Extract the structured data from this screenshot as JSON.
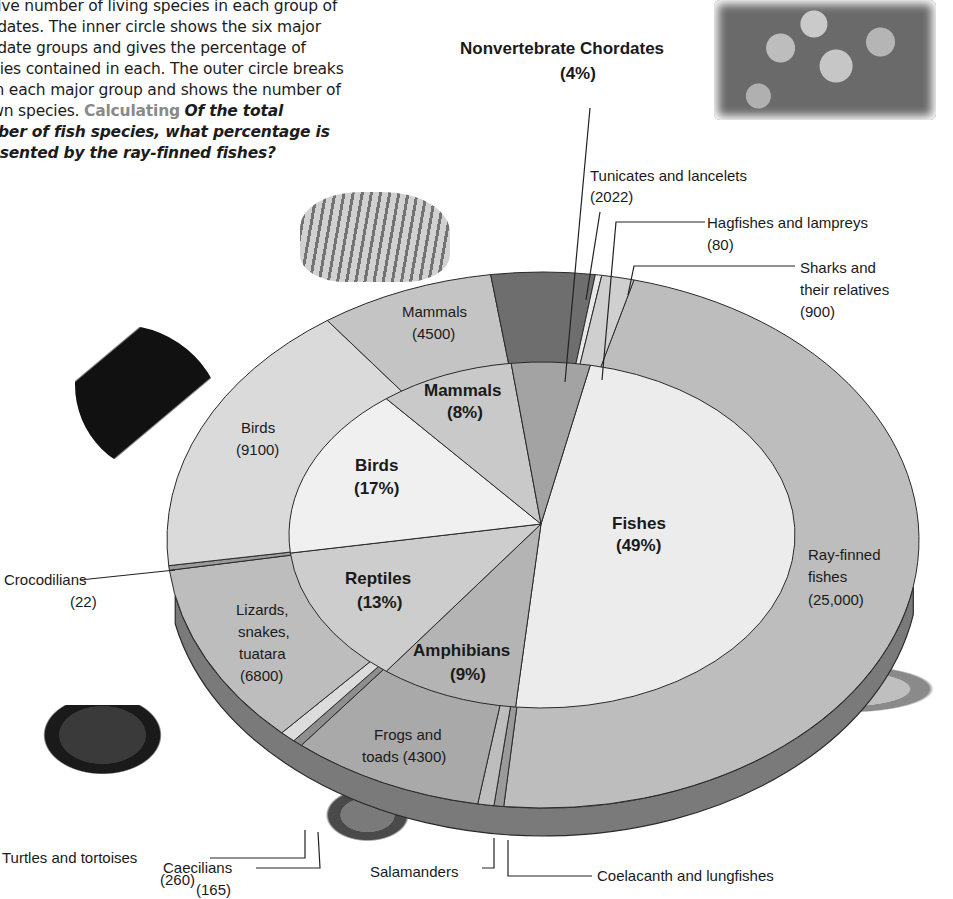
{
  "caption": {
    "line1": "ative number of living species in each group of",
    "line2": "ordates. The inner circle shows the six major",
    "line3": "ordate groups and gives the percentage of",
    "line4": "ecies contained in each. The outer circle breaks",
    "line5": "wn each major group and shows the number of",
    "line6_prefix": "own species. ",
    "keyword": "Calculating",
    "question_part1": "Of the total",
    "question_line2": "mber of fish species, what percentage is",
    "question_line3": "resented by the ray-finned fishes?"
  },
  "chart_data": {
    "type": "pie",
    "title": "",
    "subtype": "nested donut (3D)",
    "inner_ring": {
      "categories": [
        "Fishes",
        "Amphibians",
        "Reptiles",
        "Birds",
        "Mammals",
        "Nonvertebrate Chordates"
      ],
      "values": [
        49,
        9,
        13,
        17,
        8,
        4
      ],
      "unit": "%"
    },
    "outer_ring": {
      "categories": [
        "Ray-finned fishes",
        "Coelacanth and lungfishes",
        "Sharks and their relatives",
        "Hagfishes and lampreys",
        "Frogs and toads",
        "Salamanders",
        "Caecilians",
        "Turtles and tortoises",
        "Lizards, snakes, tuatara",
        "Crocodilians",
        "Birds",
        "Mammals",
        "Tunicates and lancelets"
      ],
      "parent": [
        "Fishes",
        "Fishes",
        "Fishes",
        "Fishes",
        "Amphibians",
        "Amphibians",
        "Amphibians",
        "Reptiles",
        "Reptiles",
        "Reptiles",
        "Birds",
        "Mammals",
        "Nonvertebrate Chordates"
      ],
      "values": [
        25000,
        null,
        900,
        80,
        4300,
        null,
        165,
        260,
        6800,
        22,
        9100,
        4500,
        2022
      ],
      "unit": "species"
    },
    "legend": "none"
  },
  "labels": {
    "nonvert_title": "Nonvertebrate Chordates",
    "nonvert_pct": "(4%)",
    "tunicates": "Tunicates and lancelets",
    "tunicates_n": "(2022)",
    "hagfishes": "Hagfishes and lampreys",
    "hagfishes_n": "(80)",
    "sharks1": "Sharks and",
    "sharks2": "their relatives",
    "sharks_n": "(900)",
    "mammals_outer": "Mammals",
    "mammals_outer_n": "(4500)",
    "mammals_inner": "Mammals",
    "mammals_inner_pct": "(8%)",
    "birds_outer": "Birds",
    "birds_outer_n": "(9100)",
    "birds_inner": "Birds",
    "birds_inner_pct": "(17%)",
    "fishes_inner": "Fishes",
    "fishes_inner_pct": "(49%)",
    "rayfinned1": "Ray-finned",
    "rayfinned2": "fishes",
    "rayfinned_n": "(25,000)",
    "crocodilians": "Crocodilians",
    "crocodilians_n": "(22)",
    "lizards1": "Lizards,",
    "lizards2": "snakes,",
    "lizards3": "tuatara",
    "lizards_n": "(6800)",
    "reptiles_inner": "Reptiles",
    "reptiles_inner_pct": "(13%)",
    "amphibians_inner": "Amphibians",
    "amphibians_inner_pct": "(9%)",
    "frogs1": "Frogs and",
    "frogs2": "toads (4300)",
    "turtles": "Turtles and tortoises",
    "turtles_n": "(260)",
    "caecilians": "Caecilians",
    "caecilians_n": "(165)",
    "salamanders": "Salamanders",
    "coelacanth": "Coelacanth and lungfishes"
  },
  "geometry": {
    "cx": 543,
    "cy": 540,
    "rx": 376,
    "ry": 268,
    "depth": 28,
    "icx": 542,
    "icy": 535,
    "irx": 253,
    "iry": 173,
    "apex_x": 541,
    "apex_y": 524
  },
  "colors": {
    "outline": "#2a2a2a",
    "inner_light": "#ececec",
    "inner_mid": "#c9c9c9",
    "inner_dark": "#a6a6a6",
    "outer_light": "#dadada",
    "outer_mid": "#bdbdbd",
    "outer_dark": "#9a9a9a",
    "dark_wedge": "#6e6e6e",
    "rim": "#7a7a7a"
  },
  "outer_segments": [
    {
      "name": "ray-finned",
      "a0": 14,
      "a1": 186,
      "fill": "#bdbdbd"
    },
    {
      "name": "coelacanth",
      "a0": 186,
      "a1": 187.5,
      "fill": "#9a9a9a"
    },
    {
      "name": "salamanders",
      "a0": 187.5,
      "a1": 190,
      "fill": "#bdbdbd"
    },
    {
      "name": "frogs",
      "a0": 190,
      "a1": 220,
      "fill": "#a9a9a9"
    },
    {
      "name": "caecilians",
      "a0": 220,
      "a1": 221.5,
      "fill": "#8e8e8e"
    },
    {
      "name": "turtles",
      "a0": 221.5,
      "a1": 224,
      "fill": "#dcdcdc"
    },
    {
      "name": "lizards",
      "a0": 224,
      "a1": 263.5,
      "fill": "#bdbdbd"
    },
    {
      "name": "crocodilians",
      "a0": 263.5,
      "a1": 264.5,
      "fill": "#9a9a9a"
    },
    {
      "name": "birds",
      "a0": 264.5,
      "a1": 325,
      "fill": "#dadada"
    },
    {
      "name": "mammals",
      "a0": 325,
      "a1": 352,
      "fill": "#c4c4c4"
    },
    {
      "name": "tunicates",
      "a0": 352,
      "a1": 8,
      "fill": "#6e6e6e"
    },
    {
      "name": "hagfishes",
      "a0": 8,
      "a1": 9,
      "fill": "#e8e8e8"
    },
    {
      "name": "sharks",
      "a0": 9,
      "a1": 14,
      "fill": "#cfcfcf"
    }
  ],
  "inner_segments": [
    {
      "name": "fishes",
      "a0": 11,
      "a1": 186,
      "fill": "#ececec"
    },
    {
      "name": "amphibians",
      "a0": 186,
      "a1": 218,
      "fill": "#b4b4b4"
    },
    {
      "name": "reptiles",
      "a0": 218,
      "a1": 264,
      "fill": "#cdcdcd"
    },
    {
      "name": "birds",
      "a0": 264,
      "a1": 322,
      "fill": "#f0f0f0"
    },
    {
      "name": "mammals",
      "a0": 322,
      "a1": 353,
      "fill": "#c9c9c9"
    },
    {
      "name": "nonvertebrates",
      "a0": 353,
      "a1": 11,
      "fill": "#a3a3a3"
    }
  ]
}
